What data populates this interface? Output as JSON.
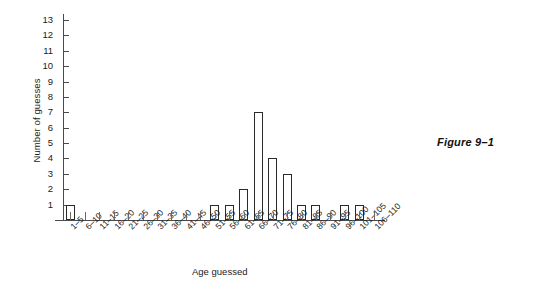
{
  "figure": {
    "caption": "Figure 9–1"
  },
  "chart_data": {
    "type": "bar",
    "title": "",
    "xlabel": "Age guessed",
    "ylabel": "Number of guesses",
    "categories": [
      "1–5",
      "6–10",
      "11–15",
      "16–20",
      "21–25",
      "26–30",
      "31–35",
      "36–40",
      "41–45",
      "46–50",
      "51–55",
      "56–60",
      "61–65",
      "66–70",
      "71–75",
      "76–80",
      "81–85",
      "86–90",
      "91–95",
      "96–100",
      "101–105",
      "106–110"
    ],
    "values": [
      1,
      0,
      0,
      0,
      0,
      0,
      0,
      0,
      0,
      0,
      1,
      1,
      2,
      7,
      4,
      3,
      1,
      1,
      0,
      1,
      1,
      0
    ],
    "ylim": [
      0,
      13
    ],
    "ytick_labels": [
      "1",
      "2",
      "3",
      "4",
      "5",
      "6",
      "7",
      "8",
      "9",
      "10",
      "11",
      "12",
      "13"
    ],
    "ytick_values": [
      1,
      2,
      3,
      4,
      5,
      6,
      7,
      8,
      9,
      10,
      11,
      12,
      13
    ],
    "grid": false,
    "legend": null,
    "bar_fill_color": "#ffffff",
    "bar_edge_color": "#2a2a2a",
    "axis_color": "#4a4a4a"
  }
}
